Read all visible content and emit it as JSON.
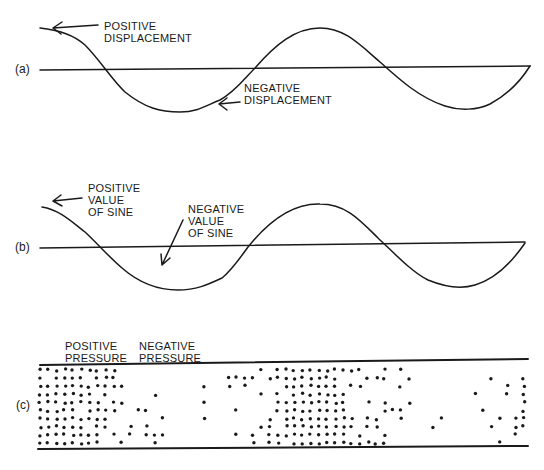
{
  "figure": {
    "panels": [
      {
        "id": "a",
        "label": "(a)",
        "annotations": [
          {
            "text": "POSITIVE\nDISPLACEMENT"
          },
          {
            "text": "NEGATIVE\nDISPLACEMENT"
          }
        ]
      },
      {
        "id": "b",
        "label": "(b)",
        "annotations": [
          {
            "text": "POSITIVE\nVALUE\nOF SINE"
          },
          {
            "text": "NEGATIVE\nVALUE\nOF SINE"
          }
        ]
      },
      {
        "id": "c",
        "label": "(c)",
        "annotations": [
          {
            "text": "POSITIVE\nPRESSURE"
          },
          {
            "text": "NEGATIVE\nPRESSURE"
          }
        ]
      }
    ],
    "colors": {
      "ink": "#1a1a1a",
      "background": "#ffffff"
    }
  }
}
